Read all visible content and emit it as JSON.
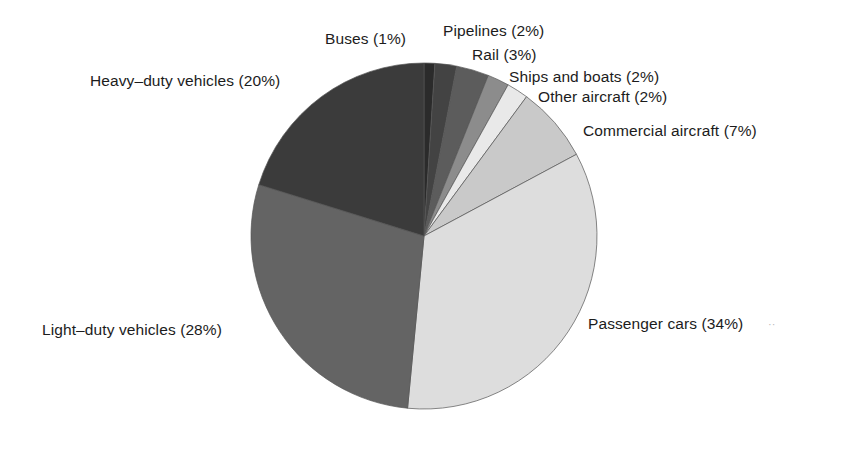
{
  "chart_data": {
    "type": "pie",
    "title": "",
    "subtitle": "",
    "xlabel": "",
    "ylabel": "",
    "legend_position": "none",
    "grid": false,
    "start_angle_deg": 0,
    "direction": "clockwise",
    "unit": "%",
    "categories": [
      "Buses",
      "Pipelines",
      "Rail",
      "Ships and boats",
      "Other aircraft",
      "Commercial aircraft",
      "Passenger cars",
      "Light-duty vehicles",
      "Heavy-duty vehicles"
    ],
    "values": [
      1,
      2,
      3,
      2,
      2,
      7,
      34,
      28,
      20
    ],
    "slices": [
      {
        "label": "Buses",
        "display_label": "Buses (1%)",
        "value": 1,
        "color": "#2b2b2b"
      },
      {
        "label": "Pipelines",
        "display_label": "Pipelines (2%)",
        "value": 2,
        "color": "#434343"
      },
      {
        "label": "Rail",
        "display_label": "Rail (3%)",
        "value": 3,
        "color": "#5c5c5c"
      },
      {
        "label": "Ships and boats",
        "display_label": "Ships and boats (2%)",
        "value": 2,
        "color": "#8c8c8c"
      },
      {
        "label": "Other aircraft",
        "display_label": "Other aircraft (2%)",
        "value": 2,
        "color": "#e9e9e9"
      },
      {
        "label": "Commercial aircraft",
        "display_label": "Commercial aircraft (7%)",
        "value": 7,
        "color": "#c9c9c9"
      },
      {
        "label": "Passenger cars",
        "display_label": "Passenger cars (34%)",
        "value": 34,
        "color": "#dddddd"
      },
      {
        "label": "Light-duty vehicles",
        "display_label": "Light–duty vehicles (28%)",
        "value": 28,
        "color": "#646464"
      },
      {
        "label": "Heavy-duty vehicles",
        "display_label": "Heavy–duty vehicles (20%)",
        "value": 20,
        "color": "#3b3b3b"
      }
    ]
  },
  "labels": {
    "buses": "Buses (1%)",
    "pipelines": "Pipelines (2%)",
    "rail": "Rail (3%)",
    "ships_and_boats": "Ships and boats (2%)",
    "other_aircraft": "Other aircraft (2%)",
    "commercial_aircraft": "Commercial aircraft (7%)",
    "passenger_cars": "Passenger cars (34%)",
    "light_duty_vehicles": "Light–duty vehicles (28%)",
    "heavy_duty_vehicles": "Heavy–duty vehicles (20%)"
  },
  "artifacts": {
    "scan_speck": "··"
  },
  "geometry": {
    "center_x": 424,
    "center_y": 236,
    "radius": 173
  },
  "colors": {
    "background": "#ffffff",
    "text": "#1c1c1c",
    "outline": "#555555"
  }
}
